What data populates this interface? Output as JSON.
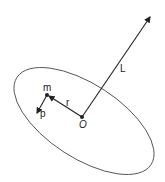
{
  "diagram": {
    "labels": {
      "mass": "m",
      "position": "r",
      "momentum": "p",
      "origin": "O",
      "angular_momentum": "L"
    },
    "stroke_color": "#222222",
    "ellipse_color": "#555555"
  }
}
